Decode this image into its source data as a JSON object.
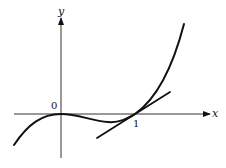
{
  "diagram": {
    "axes": {
      "x_label": "x",
      "y_label": "y",
      "origin_label": "0",
      "x_tick_label": "1"
    },
    "elements": [
      {
        "type": "axis",
        "name": "x-axis"
      },
      {
        "type": "axis",
        "name": "y-axis"
      },
      {
        "type": "curve",
        "name": "function-curve"
      },
      {
        "type": "line",
        "name": "tangent-line-at-x-1"
      }
    ],
    "colors": {
      "stroke": "#111111",
      "axis": "#333333",
      "background": "#ffffff"
    }
  }
}
